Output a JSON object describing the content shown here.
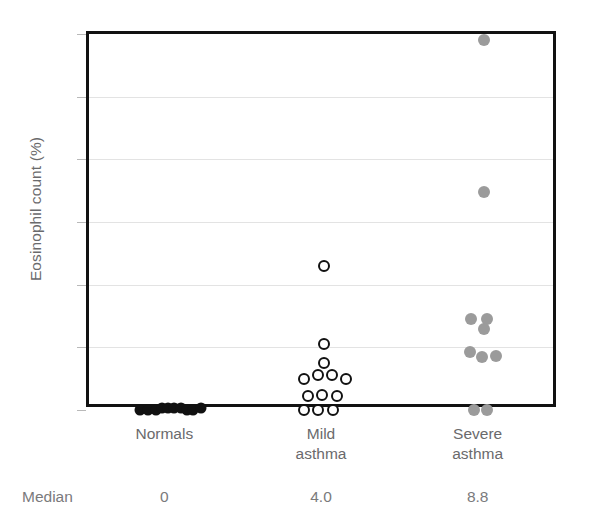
{
  "chart_data": {
    "type": "scatter",
    "title": "",
    "subtitle": "",
    "xlabel": "",
    "ylabel": "Eosinophil count (%)",
    "ylim": [
      0,
      60
    ],
    "yticks": [
      0,
      10,
      20,
      30,
      40,
      50,
      60
    ],
    "ytick_labels": [
      "0",
      "10",
      "20",
      "30",
      "40",
      "50",
      "60"
    ],
    "grid": "horizontal",
    "legend": "none",
    "categories": [
      "Normals",
      "Mild asthma",
      "Severe asthma"
    ],
    "category_labels": [
      "Normals",
      "Mild\nasthma",
      "Severe\nasthma"
    ],
    "series": [
      {
        "name": "Normals",
        "marker": "filled-circle",
        "color": "#111111",
        "median": 0,
        "median_label": "0",
        "points": [
          {
            "x": -0.175,
            "y": 0.0
          },
          {
            "x": -0.125,
            "y": 0.0
          },
          {
            "x": -0.075,
            "y": 0.0
          },
          {
            "x": -0.035,
            "y": 0.3
          },
          {
            "x": 0.005,
            "y": 0.3
          },
          {
            "x": 0.045,
            "y": 0.3
          },
          {
            "x": 0.085,
            "y": 0.3
          },
          {
            "x": 0.125,
            "y": 0.0
          },
          {
            "x": 0.165,
            "y": 0.0
          },
          {
            "x": 0.215,
            "y": 0.3
          }
        ]
      },
      {
        "name": "Mild asthma",
        "marker": "open-circle",
        "color": "#111111",
        "median": 4.0,
        "median_label": "4.0",
        "points": [
          {
            "x": 0.0,
            "y": 23.0
          },
          {
            "x": 0.0,
            "y": 10.5
          },
          {
            "x": 0.0,
            "y": 7.5
          },
          {
            "x": -0.13,
            "y": 5.0
          },
          {
            "x": -0.04,
            "y": 5.6
          },
          {
            "x": 0.05,
            "y": 5.6
          },
          {
            "x": 0.14,
            "y": 5.0
          },
          {
            "x": -0.1,
            "y": 2.2
          },
          {
            "x": -0.01,
            "y": 2.4
          },
          {
            "x": 0.08,
            "y": 2.2
          },
          {
            "x": -0.13,
            "y": 0.0
          },
          {
            "x": -0.04,
            "y": 0.0
          },
          {
            "x": 0.06,
            "y": 0.0
          }
        ]
      },
      {
        "name": "Severe asthma",
        "marker": "filled-circle",
        "color": "#9b9b9b",
        "median": 8.8,
        "median_label": "8.8",
        "points": [
          {
            "x": 0.02,
            "y": 59.0
          },
          {
            "x": 0.02,
            "y": 34.8
          },
          {
            "x": -0.06,
            "y": 14.5
          },
          {
            "x": 0.04,
            "y": 14.6
          },
          {
            "x": 0.02,
            "y": 12.9
          },
          {
            "x": -0.07,
            "y": 9.3
          },
          {
            "x": 0.01,
            "y": 8.4
          },
          {
            "x": 0.1,
            "y": 8.6
          },
          {
            "x": -0.04,
            "y": 0.0
          },
          {
            "x": 0.04,
            "y": 0.0
          }
        ]
      }
    ]
  },
  "median_row": {
    "label": "Median",
    "values": [
      "0",
      "4.0",
      "8.8"
    ]
  }
}
